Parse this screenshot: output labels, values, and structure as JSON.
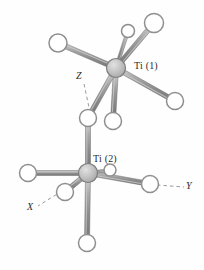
{
  "figure": {
    "type": "molecular-structure-diagram",
    "caption": "",
    "background_color": "#fefefe"
  },
  "colors": {
    "bond_fill": "#8a8a8a",
    "bond_highlight": "#c9c9c9",
    "bond_edge": "#6e6e6e",
    "atom_outline": "#8f8f8f",
    "atom_fill": "#ffffff",
    "metal_fill": "#bdbdbd",
    "metal_outline": "#7d7d7d",
    "text": "#2b2b2b",
    "axis_dash": "#9a9a9a"
  },
  "labels": {
    "ti1": "Ti (1)",
    "ti2": "Ti (2)"
  },
  "axes": [
    {
      "name": "z-axis",
      "label": "Z",
      "x": 76,
      "y": 72
    },
    {
      "name": "x-axis",
      "label": "X",
      "x": 27,
      "y": 203
    },
    {
      "name": "y-axis",
      "label": "Y",
      "x": 185,
      "y": 183
    }
  ],
  "chart_data": {
    "type": "scatter",
    "title": "",
    "xlabel": "",
    "ylabel": "",
    "metal_centers": [
      {
        "id": "Ti1",
        "label": "Ti (1)",
        "cx": 116,
        "cy": 68,
        "r": 9.5
      },
      {
        "id": "Ti2",
        "label": "Ti (2)",
        "cx": 88,
        "cy": 173,
        "r": 9.5
      }
    ],
    "ligand_atoms": [
      {
        "id": "L1",
        "cx": 58,
        "cy": 43,
        "r": 9.0,
        "bonded_to": "Ti1"
      },
      {
        "id": "L2",
        "cx": 128,
        "cy": 31,
        "r": 6.5,
        "bonded_to": "Ti1"
      },
      {
        "id": "L3",
        "cx": 154,
        "cy": 23,
        "r": 9.5,
        "bonded_to": "Ti1"
      },
      {
        "id": "L4",
        "cx": 175,
        "cy": 101,
        "r": 8.5,
        "bonded_to": "Ti1"
      },
      {
        "id": "L5",
        "cx": 113,
        "cy": 121,
        "r": 8.5,
        "bonded_to": "Ti1"
      },
      {
        "id": "BR",
        "cx": 88,
        "cy": 118,
        "r": 8.5,
        "bonded_to": "Ti1,Ti2",
        "bridging": true
      },
      {
        "id": "L6",
        "cx": 28,
        "cy": 173,
        "r": 8.5,
        "bonded_to": "Ti2"
      },
      {
        "id": "L7",
        "cx": 65,
        "cy": 192,
        "r": 8.5,
        "bonded_to": "Ti2"
      },
      {
        "id": "L8",
        "cx": 150,
        "cy": 184,
        "r": 8.5,
        "bonded_to": "Ti2"
      },
      {
        "id": "L9",
        "cx": 87,
        "cy": 243,
        "r": 8.5,
        "bonded_to": "Ti2"
      },
      {
        "id": "L10",
        "cx": 110,
        "cy": 170,
        "r": 6.0,
        "bonded_to": "Ti2"
      }
    ],
    "bonds": [
      {
        "from": "Ti1",
        "to": "L1",
        "width": 5.0
      },
      {
        "from": "Ti1",
        "to": "L2",
        "width": 3.2
      },
      {
        "from": "Ti1",
        "to": "L3",
        "width": 5.0
      },
      {
        "from": "Ti1",
        "to": "L4",
        "width": 5.0
      },
      {
        "from": "Ti1",
        "to": "L5",
        "width": 5.0
      },
      {
        "from": "Ti1",
        "to": "BR",
        "width": 5.0
      },
      {
        "from": "BR",
        "to": "Ti2",
        "width": 5.0
      },
      {
        "from": "Ti2",
        "to": "L6",
        "width": 5.0
      },
      {
        "from": "Ti2",
        "to": "L7",
        "width": 5.0
      },
      {
        "from": "Ti2",
        "to": "L8",
        "width": 5.0
      },
      {
        "from": "Ti2",
        "to": "L9",
        "width": 5.0
      },
      {
        "from": "Ti2",
        "to": "L10",
        "width": 3.0
      }
    ],
    "axis_vectors": [
      {
        "name": "Z",
        "x1": 84,
        "y1": 84,
        "x2": 90,
        "y2": 112
      },
      {
        "name": "X",
        "x1": 62,
        "y1": 191,
        "x2": 38,
        "y2": 206
      },
      {
        "name": "Y",
        "x1": 157,
        "y1": 185,
        "x2": 184,
        "y2": 187
      }
    ]
  }
}
